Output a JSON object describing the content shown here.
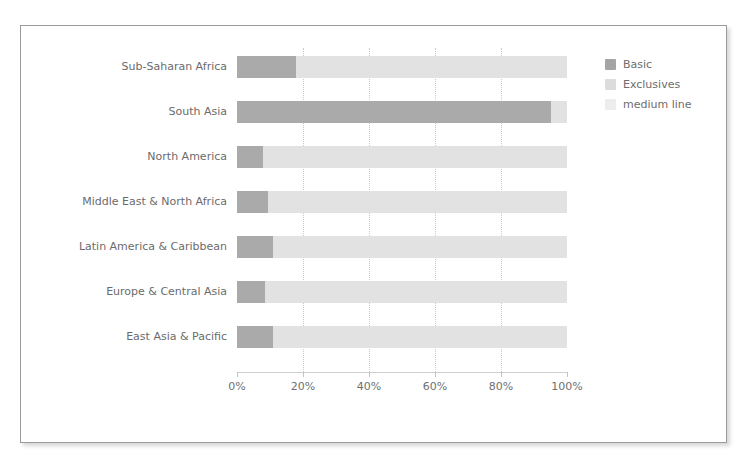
{
  "chart_data": {
    "type": "bar",
    "orientation": "horizontal",
    "stacked": true,
    "title": "",
    "xlabel": "",
    "ylabel": "",
    "xlim": [
      0,
      100
    ],
    "grid": true,
    "legend_position": "right",
    "xtick_labels": [
      "0%",
      "20%",
      "40%",
      "60%",
      "80%",
      "100%"
    ],
    "xticks": [
      0,
      20,
      40,
      60,
      80,
      100
    ],
    "categories": [
      "Sub-Saharan Africa",
      "South Asia",
      "North America",
      "Middle East & North Africa",
      "Latin America & Caribbean",
      "Europe & Central Asia",
      "East Asia & Pacific"
    ],
    "series": [
      {
        "name": "Basic",
        "color": "#aaaaaa",
        "values": [
          18,
          95,
          8,
          9.5,
          11,
          8.5,
          11
        ]
      },
      {
        "name": "Exclusives",
        "color": "#e2e2e2",
        "values": [
          82,
          5,
          92,
          90.5,
          89,
          91.5,
          89
        ]
      },
      {
        "name": "medium line",
        "color": "#eeeeee",
        "values": [
          0,
          0,
          0,
          0,
          0,
          0,
          0
        ]
      }
    ]
  },
  "legend": {
    "items": [
      {
        "label": "Basic",
        "swatch": "legend-swatch-basic"
      },
      {
        "label": "Exclusives",
        "swatch": "legend-swatch-exclusives"
      },
      {
        "label": "medium line",
        "swatch": "legend-swatch-medium"
      }
    ]
  },
  "colors": {
    "basic": "#aaaaaa",
    "exclusives": "#e2e2e2",
    "medium_line": "#eeeeee",
    "gridline": "#c9c9c9",
    "axis": "#cfcfcf",
    "text": "#6b6b6b",
    "card_border": "#9a9a9a",
    "background": "#ffffff"
  }
}
